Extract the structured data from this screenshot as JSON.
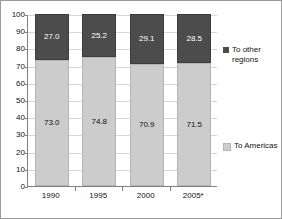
{
  "chart_data": {
    "type": "bar",
    "subtype": "stacked-100-percent",
    "title": "",
    "xlabel": "",
    "ylabel": "",
    "ylim": [
      0,
      100
    ],
    "ytick_step": 10,
    "grid": true,
    "legend_position": "right",
    "categories": [
      "1990",
      "1995",
      "2000",
      "2005*"
    ],
    "series": [
      {
        "name": "To Americas",
        "color": "#cccccc",
        "values": [
          73.0,
          74.8,
          70.9,
          71.5
        ],
        "labels": [
          "73.0",
          "74.8",
          "70.9",
          "71.5"
        ]
      },
      {
        "name": "To other regions",
        "color": "#4c4c4c",
        "values": [
          27.0,
          25.2,
          29.1,
          28.5
        ],
        "labels": [
          "27.0",
          "25.2",
          "29.1",
          "28.5"
        ]
      }
    ],
    "ytick_labels": [
      "100",
      "90",
      "80",
      "70",
      "60",
      "50",
      "40",
      "30",
      "20",
      "10",
      "0"
    ]
  },
  "legend": {
    "entries": [
      {
        "label": "To other regions",
        "color": "#4c4c4c"
      },
      {
        "label": "To Americas",
        "color": "#cccccc"
      }
    ]
  }
}
